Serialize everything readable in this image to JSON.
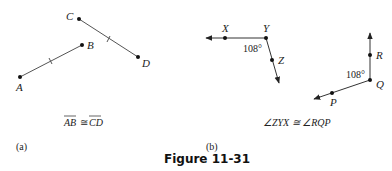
{
  "figure": {
    "title": "Figure 11-31",
    "panels": [
      {
        "id": "a",
        "label": "(a)",
        "caption_left": "AB",
        "caption_symbol": "≅",
        "caption_right": "CD",
        "points": {
          "A": "A",
          "B": "B",
          "C": "C",
          "D": "D"
        }
      },
      {
        "id": "b",
        "label": "(b)",
        "caption": "∠ZYX ≅ ∠RQP",
        "angle_1": "108°",
        "angle_2": "108°",
        "points": {
          "X": "X",
          "Y": "Y",
          "Z": "Z",
          "P": "P",
          "Q": "Q",
          "R": "R"
        }
      }
    ]
  }
}
